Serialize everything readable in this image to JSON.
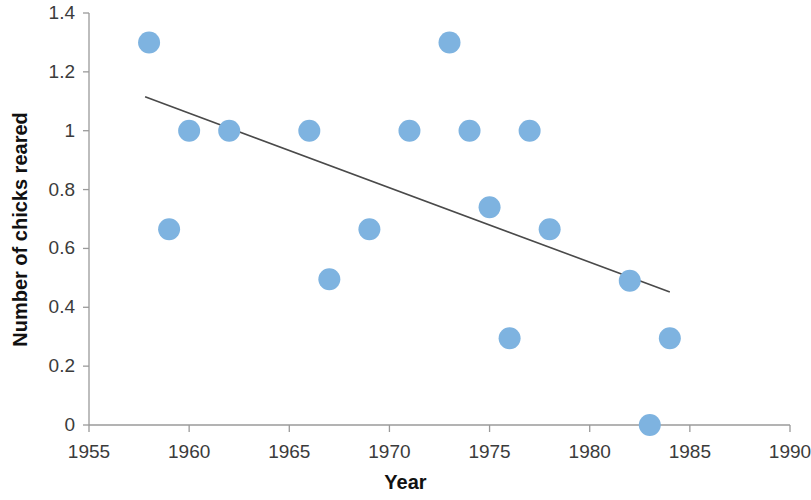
{
  "chart_data": {
    "type": "scatter",
    "title": "",
    "xlabel": "Year",
    "ylabel": "Number of chicks reared",
    "xlim": [
      1955,
      1990
    ],
    "ylim": [
      0,
      1.4
    ],
    "grid": false,
    "legend": "none",
    "x_ticks": [
      1955,
      1960,
      1965,
      1970,
      1975,
      1980,
      1985,
      1990
    ],
    "x_tick_labels": [
      "1955",
      "1960",
      "1965",
      "1970",
      "1975",
      "1980",
      "1985",
      "1990"
    ],
    "y_ticks": [
      0,
      0.2,
      0.4,
      0.6,
      0.8,
      1,
      1.2,
      1.4
    ],
    "y_tick_labels": [
      "0",
      "0.2",
      "0.4",
      "0.6",
      "0.8",
      "1",
      "1.2",
      "1.4"
    ],
    "series": [
      {
        "name": "Chicks reared per year",
        "marker": "circle",
        "marker_color": "#7EB3E0",
        "points": [
          {
            "x": 1958,
            "y": 1.3
          },
          {
            "x": 1959,
            "y": 0.665
          },
          {
            "x": 1960,
            "y": 1.0
          },
          {
            "x": 1962,
            "y": 1.0
          },
          {
            "x": 1966,
            "y": 1.0
          },
          {
            "x": 1967,
            "y": 0.495
          },
          {
            "x": 1969,
            "y": 0.665
          },
          {
            "x": 1971,
            "y": 1.0
          },
          {
            "x": 1973,
            "y": 1.3
          },
          {
            "x": 1974,
            "y": 1.0
          },
          {
            "x": 1975,
            "y": 0.74
          },
          {
            "x": 1976,
            "y": 0.295
          },
          {
            "x": 1977,
            "y": 1.0
          },
          {
            "x": 1978,
            "y": 0.665
          },
          {
            "x": 1982,
            "y": 0.49
          },
          {
            "x": 1983,
            "y": 0.0
          },
          {
            "x": 1984,
            "y": 0.295
          }
        ]
      }
    ],
    "trendline": {
      "type": "linear",
      "color": "#4a4a4a",
      "x_start": 1957.8,
      "y_start": 1.115,
      "x_end": 1984.0,
      "y_end": 0.452
    }
  },
  "axis": {
    "x_title": "Year",
    "y_title": "Number of chicks reared"
  }
}
